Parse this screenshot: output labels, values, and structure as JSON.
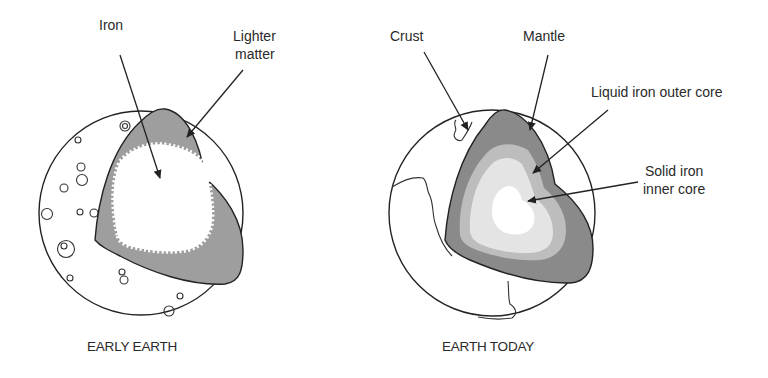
{
  "figure": {
    "panels": [
      {
        "id": "early-earth",
        "caption": "EARLY EARTH",
        "labels": {
          "iron": "Iron",
          "lighter_matter_line1": "Lighter",
          "lighter_matter_line2": "matter"
        }
      },
      {
        "id": "earth-today",
        "caption": "EARTH TODAY",
        "labels": {
          "crust": "Crust",
          "mantle": "Mantle",
          "outer_core": "Liquid iron outer core",
          "inner_core_line1": "Solid iron",
          "inner_core_line2": "inner core"
        }
      }
    ],
    "colors": {
      "mantle_gray": "#8a8a8a",
      "lighter_matter_gray": "#9e9e9e",
      "outer_core_mid": "#bdbdbd",
      "outer_core_light": "#e4e4e4",
      "inner_core": "#ffffff",
      "outline": "#222222"
    }
  }
}
